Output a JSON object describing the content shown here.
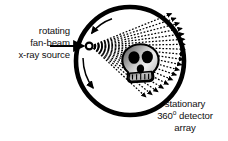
{
  "diagram": {
    "colors": {
      "stroke": "#000000",
      "background": "#ffffff",
      "text": "#111111",
      "skull_light": "#f2f2f2",
      "skull_mid": "#b8b8b8",
      "skull_dark": "#5a5a5a",
      "socket": "#000000"
    },
    "labels": {
      "source": {
        "line1": "rotating",
        "line2": "fan-beam",
        "line3": "x-ray source"
      },
      "detector": {
        "line1": "stationary",
        "line2_pre": "360",
        "line2_degree": "o",
        "line2_post": " detector",
        "line3": "array"
      }
    },
    "parts": {
      "gantry_ring": "gantry-ring",
      "xray_source": "x-ray-source-point",
      "fan_beam": "fan-beam-rays",
      "detector_arc": "detector-array-arc",
      "patient": "skull-cross-section",
      "rotation_arrow_top": "rotation-arrow-top",
      "rotation_arrow_bottom": "rotation-arrow-bottom",
      "pointer_arrow": "source-label-pointer"
    },
    "geometry": {
      "ring_center_x": 130,
      "ring_center_y": 61,
      "ring_radius": 54,
      "source_x": 89,
      "source_y": 46,
      "fan_ray_count": 19,
      "fan_span_degrees": 64
    }
  }
}
